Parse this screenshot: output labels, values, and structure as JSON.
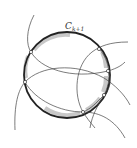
{
  "diagram": {
    "title": "",
    "main_circle": {
      "label": "C",
      "label_subscript": "k+1",
      "cx": 67,
      "cy": 75,
      "r": 43,
      "stroke": "#222222"
    },
    "shaded_arcs_color": "#c8c8c8",
    "intersection_points": [
      {
        "x": 31,
        "y": 52
      },
      {
        "x": 99,
        "y": 49
      },
      {
        "x": 108,
        "y": 71
      },
      {
        "x": 25,
        "y": 82
      },
      {
        "x": 104,
        "y": 95
      },
      {
        "x": 83,
        "y": 112
      }
    ],
    "other_circle_color": "#444444"
  }
}
